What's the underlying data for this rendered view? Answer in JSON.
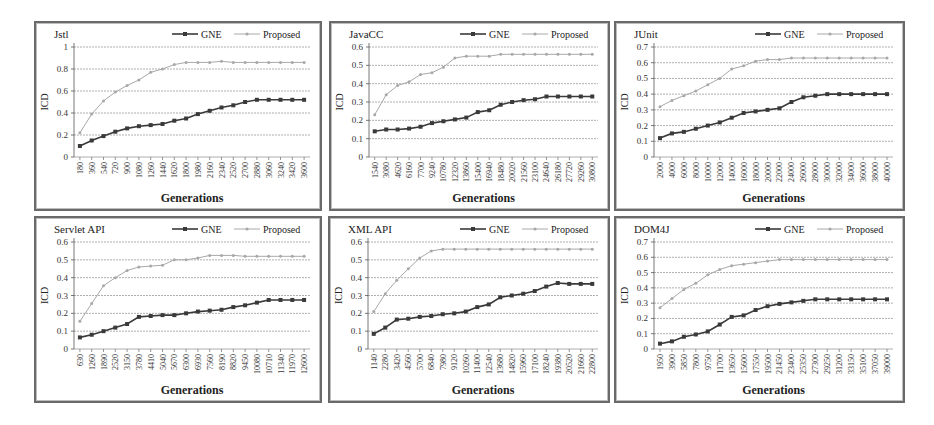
{
  "figure": {
    "y_axis_label": "ICD",
    "x_axis_label": "Generations",
    "legend": [
      "GNE",
      "Proposed"
    ],
    "colors": {
      "GNE": "#3a3a3a",
      "Proposed": "#a8a8a8",
      "grid": "#9a9a9a",
      "axis": "#555555",
      "frame": "#6a6a6a"
    }
  },
  "chart_data": [
    {
      "type": "line",
      "title": "Jstl",
      "xlabel": "Generations",
      "ylabel": "ICD",
      "ylim": [
        0,
        1
      ],
      "yticks": [
        "0",
        "0.2",
        "0.4",
        "0.6",
        "0.8",
        "1"
      ],
      "grid": true,
      "legend_position": "top-right",
      "categories": [
        "180",
        "360",
        "540",
        "720",
        "900",
        "1080",
        "1260",
        "1440",
        "1620",
        "1800",
        "1980",
        "2160",
        "2340",
        "2520",
        "2700",
        "2880",
        "3060",
        "3240",
        "3420",
        "3600"
      ],
      "series": [
        {
          "name": "GNE",
          "values": [
            0.1,
            0.15,
            0.19,
            0.23,
            0.26,
            0.28,
            0.29,
            0.3,
            0.33,
            0.35,
            0.39,
            0.42,
            0.45,
            0.47,
            0.5,
            0.52,
            0.52,
            0.52,
            0.52,
            0.52
          ]
        },
        {
          "name": "Proposed",
          "values": [
            0.22,
            0.39,
            0.51,
            0.59,
            0.65,
            0.7,
            0.77,
            0.8,
            0.84,
            0.86,
            0.86,
            0.86,
            0.87,
            0.86,
            0.86,
            0.86,
            0.86,
            0.86,
            0.86,
            0.86
          ]
        }
      ]
    },
    {
      "type": "line",
      "title": "JavaCC",
      "xlabel": "Generations",
      "ylabel": "ICD",
      "ylim": [
        0,
        0.6
      ],
      "yticks": [
        "0",
        "0.1",
        "0.2",
        "0.3",
        "0.4",
        "0.5",
        "0.6"
      ],
      "grid": true,
      "legend_position": "top-right",
      "categories": [
        "1540",
        "3080",
        "4620",
        "6160",
        "7700",
        "9240",
        "10780",
        "12320",
        "13860",
        "15400",
        "16940",
        "18480",
        "20020",
        "21560",
        "23100",
        "24640",
        "26180",
        "27720",
        "29260",
        "30800"
      ],
      "series": [
        {
          "name": "GNE",
          "values": [
            0.14,
            0.15,
            0.15,
            0.155,
            0.165,
            0.185,
            0.195,
            0.205,
            0.215,
            0.245,
            0.255,
            0.285,
            0.3,
            0.31,
            0.315,
            0.33,
            0.33,
            0.33,
            0.33,
            0.33
          ]
        },
        {
          "name": "Proposed",
          "values": [
            0.23,
            0.34,
            0.39,
            0.41,
            0.45,
            0.46,
            0.49,
            0.54,
            0.55,
            0.55,
            0.55,
            0.56,
            0.56,
            0.56,
            0.56,
            0.56,
            0.56,
            0.56,
            0.56,
            0.56
          ]
        }
      ]
    },
    {
      "type": "line",
      "title": "JUnit",
      "xlabel": "Generations",
      "ylabel": "ICD",
      "ylim": [
        0,
        0.7
      ],
      "yticks": [
        "0",
        "0.1",
        "0.2",
        "0.3",
        "0.4",
        "0.5",
        "0.6",
        "0.7"
      ],
      "grid": true,
      "legend_position": "top-right",
      "categories": [
        "2000",
        "4000",
        "6000",
        "8000",
        "10000",
        "12000",
        "14000",
        "16000",
        "18000",
        "20000",
        "22000",
        "24000",
        "26000",
        "28000",
        "30000",
        "32000",
        "34000",
        "36000",
        "38000",
        "40000"
      ],
      "series": [
        {
          "name": "GNE",
          "values": [
            0.12,
            0.15,
            0.16,
            0.18,
            0.2,
            0.22,
            0.25,
            0.28,
            0.29,
            0.3,
            0.31,
            0.35,
            0.38,
            0.39,
            0.4,
            0.4,
            0.4,
            0.4,
            0.4,
            0.4
          ]
        },
        {
          "name": "Proposed",
          "values": [
            0.32,
            0.36,
            0.39,
            0.42,
            0.46,
            0.5,
            0.56,
            0.58,
            0.61,
            0.62,
            0.62,
            0.63,
            0.63,
            0.63,
            0.63,
            0.63,
            0.63,
            0.63,
            0.63,
            0.63
          ]
        }
      ]
    },
    {
      "type": "line",
      "title": "Servlet API",
      "xlabel": "Generations",
      "ylabel": "ICD",
      "ylim": [
        0,
        0.6
      ],
      "yticks": [
        "0",
        "0.1",
        "0.2",
        "0.3",
        "0.4",
        "0.5",
        "0.6"
      ],
      "grid": true,
      "legend_position": "top-right",
      "categories": [
        "630",
        "1260",
        "1890",
        "2520",
        "3150",
        "3780",
        "4410",
        "5040",
        "5670",
        "6300",
        "6930",
        "7560",
        "8190",
        "8820",
        "9450",
        "10080",
        "10710",
        "11340",
        "11970",
        "12600"
      ],
      "series": [
        {
          "name": "GNE",
          "values": [
            0.065,
            0.08,
            0.1,
            0.12,
            0.14,
            0.18,
            0.185,
            0.19,
            0.19,
            0.2,
            0.21,
            0.215,
            0.22,
            0.235,
            0.245,
            0.26,
            0.275,
            0.275,
            0.275,
            0.275
          ]
        },
        {
          "name": "Proposed",
          "values": [
            0.155,
            0.255,
            0.355,
            0.4,
            0.44,
            0.46,
            0.465,
            0.47,
            0.5,
            0.5,
            0.51,
            0.525,
            0.525,
            0.525,
            0.52,
            0.52,
            0.52,
            0.52,
            0.52,
            0.52
          ]
        }
      ]
    },
    {
      "type": "line",
      "title": "XML API",
      "xlabel": "Generations",
      "ylabel": "ICD",
      "ylim": [
        0,
        0.6
      ],
      "yticks": [
        "0",
        "0.1",
        "0.2",
        "0.3",
        "0.4",
        "0.5",
        "0.6"
      ],
      "grid": true,
      "legend_position": "top-right",
      "categories": [
        "1140",
        "2280",
        "3420",
        "4560",
        "5700",
        "6840",
        "7980",
        "9120",
        "10260",
        "11400",
        "12540",
        "13680",
        "14820",
        "15960",
        "17100",
        "18240",
        "19380",
        "20520",
        "21660",
        "22800"
      ],
      "series": [
        {
          "name": "GNE",
          "values": [
            0.085,
            0.12,
            0.165,
            0.17,
            0.18,
            0.185,
            0.195,
            0.2,
            0.21,
            0.235,
            0.25,
            0.29,
            0.3,
            0.31,
            0.325,
            0.35,
            0.37,
            0.365,
            0.365,
            0.365
          ]
        },
        {
          "name": "Proposed",
          "values": [
            0.21,
            0.31,
            0.385,
            0.45,
            0.51,
            0.55,
            0.56,
            0.56,
            0.56,
            0.56,
            0.56,
            0.56,
            0.56,
            0.56,
            0.56,
            0.56,
            0.56,
            0.56,
            0.56,
            0.56
          ]
        }
      ]
    },
    {
      "type": "line",
      "title": "DOM4J",
      "xlabel": "Generations",
      "ylabel": "ICD",
      "ylim": [
        0,
        0.7
      ],
      "yticks": [
        "0",
        "0.1",
        "0.2",
        "0.3",
        "0.4",
        "0.5",
        "0.6",
        "0.7"
      ],
      "grid": true,
      "legend_position": "top-right",
      "categories": [
        "1950",
        "3900",
        "5850",
        "7800",
        "9750",
        "11700",
        "13650",
        "15600",
        "17550",
        "19500",
        "21450",
        "23400",
        "25350",
        "27300",
        "29250",
        "31200",
        "33150",
        "35100",
        "37050",
        "39000"
      ],
      "series": [
        {
          "name": "GNE",
          "values": [
            0.035,
            0.05,
            0.08,
            0.095,
            0.115,
            0.16,
            0.21,
            0.22,
            0.255,
            0.28,
            0.295,
            0.305,
            0.315,
            0.325,
            0.325,
            0.325,
            0.325,
            0.325,
            0.325,
            0.325
          ]
        },
        {
          "name": "Proposed",
          "values": [
            0.27,
            0.33,
            0.39,
            0.43,
            0.485,
            0.52,
            0.545,
            0.555,
            0.565,
            0.575,
            0.585,
            0.585,
            0.585,
            0.585,
            0.585,
            0.585,
            0.585,
            0.585,
            0.585,
            0.585
          ]
        }
      ]
    }
  ]
}
